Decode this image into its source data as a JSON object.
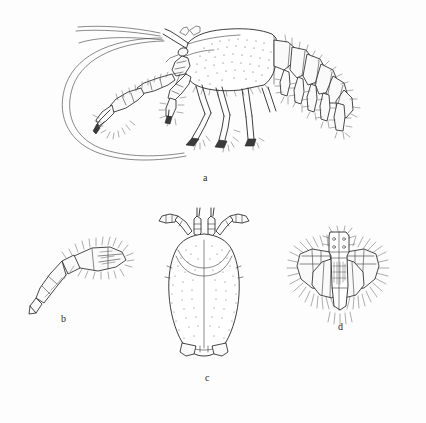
{
  "plate": {
    "title": "Crustacean morphology plate",
    "background_color": "#fdfdfd",
    "ink_color": "#2a2a2a",
    "width": 426,
    "height": 423,
    "medium": "pen-and-ink line drawing with stipple shading",
    "subject": "squat lobster (decapod crustacean)"
  },
  "figures": [
    {
      "key": "a",
      "label": "a",
      "caption_position": {
        "x": 203,
        "y": 173
      },
      "description": "whole animal, lateral view, with long curved antennal flagella, chelipeds, walking legs and abdomen bearing pleopods"
    },
    {
      "key": "b",
      "label": "b",
      "caption_position": {
        "x": 61,
        "y": 314
      },
      "description": "isolated appendage (maxilliped) with dense marginal setae"
    },
    {
      "key": "c",
      "label": "c",
      "caption_position": {
        "x": 205,
        "y": 373
      },
      "description": "carapace in dorsal view, stippled, showing rostrum, eyes and antennal peduncles"
    },
    {
      "key": "d",
      "label": "d",
      "caption_position": {
        "x": 338,
        "y": 322
      },
      "description": "tail fan: telson and uropods fringed with plumose setae"
    }
  ]
}
